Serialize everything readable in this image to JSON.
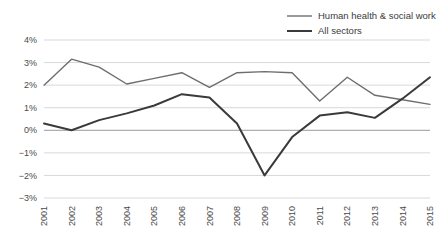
{
  "chart_data": {
    "type": "line",
    "title": "",
    "subtitle": "",
    "xlabel": "",
    "ylabel": "",
    "x": [
      "2001",
      "2002",
      "2003",
      "2004",
      "2005",
      "2006",
      "2007",
      "2008",
      "2009",
      "2010",
      "2011",
      "2012",
      "2013",
      "2014",
      "2015"
    ],
    "categories": [
      "2001",
      "2002",
      "2003",
      "2004",
      "2005",
      "2006",
      "2007",
      "2008",
      "2009",
      "2010",
      "2011",
      "2012",
      "2013",
      "2014",
      "2015"
    ],
    "ylim": [
      -3,
      4
    ],
    "ytick_labels": [
      "4%",
      "3%",
      "2%",
      "1%",
      "0%",
      "−1%",
      "−2%",
      "−3%"
    ],
    "ytick_values": [
      4,
      3,
      2,
      1,
      0,
      -1,
      -2,
      -3
    ],
    "grid": true,
    "legend_position": "top-right",
    "series": [
      {
        "name": "Human health & social work",
        "color": "#6e6e6e",
        "width": 1.4,
        "values": [
          2.0,
          3.15,
          2.8,
          2.05,
          2.3,
          2.55,
          1.9,
          2.55,
          2.6,
          2.55,
          1.3,
          2.35,
          1.55,
          1.35,
          1.15
        ]
      },
      {
        "name": "All sectors",
        "color": "#3a3a3a",
        "width": 2.0,
        "values": [
          0.3,
          0.0,
          0.45,
          0.75,
          1.1,
          1.6,
          1.45,
          0.3,
          -2.0,
          -0.3,
          0.65,
          0.8,
          0.55,
          1.4,
          2.35
        ]
      }
    ]
  },
  "legend": {
    "items": [
      {
        "label": "Human health & social work"
      },
      {
        "label": "All sectors"
      }
    ]
  }
}
